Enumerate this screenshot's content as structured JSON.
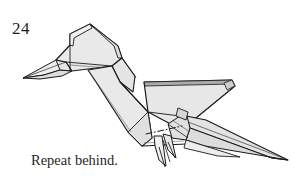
{
  "figure": {
    "step_number": "24",
    "caption": "Repeat behind.",
    "colors": {
      "paper_fill": "#e9e9e9",
      "paper_fill_light": "#f1f1f1",
      "paper_fill_shade": "#dcdcdc",
      "outline": "#1a1a1a",
      "fold_line": "#3a3a3a",
      "background": "#ffffff",
      "text": "#1f1f1f"
    },
    "line_styles": {
      "outline_label": "solid-outline",
      "valley_fold_label": "dash-dot-fold-line"
    },
    "parts": [
      {
        "name": "beak",
        "label": "beak"
      },
      {
        "name": "head",
        "label": "head"
      },
      {
        "name": "neck",
        "label": "neck"
      },
      {
        "name": "body",
        "label": "body"
      },
      {
        "name": "wing",
        "label": "wing"
      },
      {
        "name": "tail",
        "label": "tail"
      },
      {
        "name": "legs",
        "label": "legs"
      }
    ]
  }
}
